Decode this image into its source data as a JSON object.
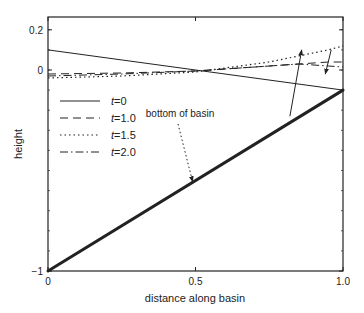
{
  "chart_data": {
    "type": "line",
    "title": "",
    "xlabel": "distance along basin",
    "ylabel": "height",
    "xlim": [
      0,
      1.0
    ],
    "ylim": [
      -1,
      0.26
    ],
    "xticks": [
      {
        "value": 0,
        "label": "0"
      },
      {
        "value": 0.5,
        "label": "0.5"
      },
      {
        "value": 1.0,
        "label": "1.0"
      }
    ],
    "yticks": [
      {
        "value": -1,
        "label": "−1"
      },
      {
        "value": 0,
        "label": "0"
      },
      {
        "value": 0.2,
        "label": "0.2"
      }
    ],
    "grid": false,
    "legend_position": "upper left",
    "series": [
      {
        "name": "t=0",
        "label_italic": "t",
        "label_rest": "=0",
        "style": "solid",
        "x": [
          0,
          1.0
        ],
        "y": [
          0.1,
          -0.1
        ]
      },
      {
        "name": "t=1.0",
        "label_italic": "t",
        "label_rest": "=1.0",
        "style": "dashed",
        "x": [
          0,
          0.25,
          0.5,
          0.6,
          0.75,
          0.85,
          0.95,
          1.0
        ],
        "y": [
          -0.02,
          -0.015,
          -0.005,
          0.005,
          0.02,
          0.03,
          0.04,
          0.04
        ]
      },
      {
        "name": "t=1.5",
        "label_italic": "t",
        "label_rest": "=1.5",
        "style": "dotted",
        "x": [
          0,
          0.25,
          0.5,
          0.6,
          0.75,
          0.85,
          0.95,
          1.0
        ],
        "y": [
          -0.04,
          -0.03,
          -0.01,
          0.01,
          0.04,
          0.07,
          0.1,
          0.12
        ]
      },
      {
        "name": "t=2.0",
        "label_italic": "t",
        "label_rest": "=2.0",
        "style": "dashdot",
        "x": [
          0,
          0.25,
          0.5,
          0.6,
          0.75,
          0.85,
          0.95,
          1.0
        ],
        "y": [
          -0.03,
          -0.02,
          -0.005,
          0.005,
          0.02,
          0.03,
          0.02,
          0.015
        ]
      },
      {
        "name": "bottom of basin",
        "style": "thick-solid",
        "x": [
          0,
          1.0
        ],
        "y": [
          -1,
          -0.1
        ]
      }
    ],
    "annotations": [
      {
        "text": "bottom of basin",
        "text_x": 0.5,
        "text_y": -0.48,
        "arrow_to": [
          0.48,
          -0.57
        ],
        "arrow_style": "dotted"
      },
      {
        "type": "arrow",
        "direction": "up",
        "from": [
          0.82,
          -0.23
        ],
        "to": [
          0.86,
          0.1
        ]
      },
      {
        "type": "arrow",
        "direction": "down",
        "from": [
          0.96,
          0.1
        ],
        "to": [
          0.94,
          -0.02
        ]
      }
    ]
  }
}
